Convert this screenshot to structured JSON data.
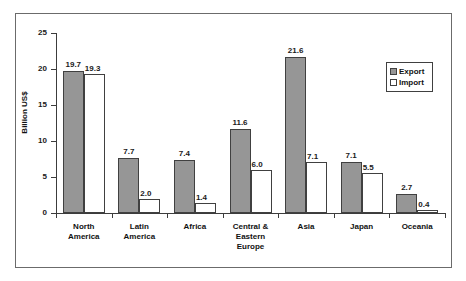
{
  "chart_data": {
    "type": "bar",
    "title": "",
    "xlabel": "",
    "ylabel": "Billion US$",
    "ylim": [
      0,
      25
    ],
    "yticks": [
      "0",
      "5",
      "10",
      "15",
      "20",
      "25"
    ],
    "grid": false,
    "legend_position": "top-right",
    "categories": [
      "North America",
      "Latin America",
      "Africa",
      "Central & Eastern Europe",
      "Asia",
      "Japan",
      "Oceania"
    ],
    "category_lines": [
      [
        "North",
        "America"
      ],
      [
        "Latin",
        "America"
      ],
      [
        "Africa"
      ],
      [
        "Central &",
        "Eastern",
        "Europe"
      ],
      [
        "Asia"
      ],
      [
        "Japan"
      ],
      [
        "Oceania"
      ]
    ],
    "series": [
      {
        "name": "Export",
        "color": "#969696",
        "values": [
          19.7,
          7.7,
          7.4,
          11.6,
          21.6,
          7.1,
          2.7
        ],
        "labels": [
          "19.7",
          "7.7",
          "7.4",
          "11.6",
          "21.6",
          "7.1",
          "2.7"
        ]
      },
      {
        "name": "Import",
        "color": "#ffffff",
        "values": [
          19.3,
          2.0,
          1.4,
          6.0,
          7.1,
          5.5,
          0.4
        ],
        "labels": [
          "19.3",
          "2.0",
          "1.4",
          "6.0",
          "7.1",
          "5.5",
          "0.4"
        ]
      }
    ]
  },
  "legend": {
    "items": [
      {
        "label": "Export",
        "swatch": "filled-gray-square"
      },
      {
        "label": "Import",
        "swatch": "empty-white-square"
      }
    ]
  },
  "colors": {
    "export_fill": "#969696",
    "import_fill": "#ffffff",
    "bar_border": "#404040",
    "axis": "#3c3c3c",
    "frame": "#6b6b6b",
    "text": "#111111"
  }
}
